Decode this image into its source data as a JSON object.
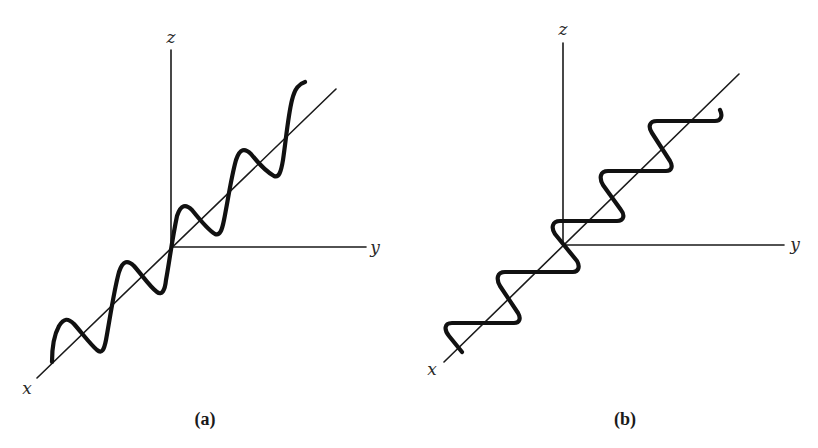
{
  "figure": {
    "panels": [
      {
        "id": "a",
        "caption": "(a)",
        "description": "Linearly polarized wave: sinusoidal oscillation in the x-z plane propagating along the x axis",
        "axes": {
          "x": "x",
          "y": "y",
          "z": "z"
        }
      },
      {
        "id": "b",
        "caption": "(b)",
        "description": "Linearly polarized wave: oscillation in the x-y plane propagating along the x axis",
        "axes": {
          "x": "x",
          "y": "y",
          "z": "z"
        }
      }
    ]
  },
  "colors": {
    "ink": "#111111",
    "background": "#ffffff"
  }
}
